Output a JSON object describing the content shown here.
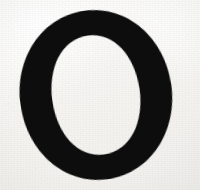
{
  "image": {
    "kind": "scanned-letterform",
    "character": "O",
    "description": "Capital letter O in a serif typeface, printed in black ink on off-white paper",
    "alt_text": "A large black serif capital letter O on a plain off-white paper background",
    "width": 200,
    "height": 190
  },
  "colors": {
    "ink": "#0d0d0d",
    "ink_edge": "#1a1a18",
    "paper": "#f5f4f1",
    "paper_highlight": "#fbfaf9",
    "paper_shadow": "#f1f0ed",
    "speck": "#5a5854"
  },
  "glyph": {
    "letter": "O",
    "case": "uppercase",
    "style": "serif",
    "stress": "oblique",
    "axis_tilt_degrees": -8,
    "outer": {
      "center_x": 96,
      "center_y": 95,
      "radius_x": 76,
      "radius_y": 85
    },
    "counter": {
      "center_x": 96,
      "center_y": 95,
      "radius_x": 44,
      "radius_y": 60
    },
    "stroke_thickness": {
      "left": 26,
      "right": 27,
      "top": 12,
      "bottom": 13
    }
  }
}
